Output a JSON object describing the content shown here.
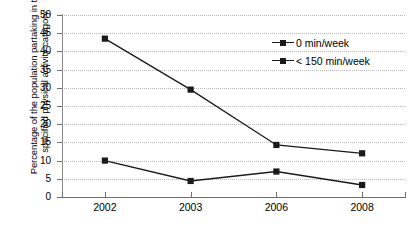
{
  "chart_data": {
    "type": "line",
    "title": "",
    "xlabel": "",
    "ylabel": "Percentage of the population partaking in the specified physical activity category",
    "categories": [
      "2002",
      "2003",
      "2006",
      "2008"
    ],
    "series": [
      {
        "name": "0 min/week",
        "values": [
          10,
          4.4,
          7,
          3.3
        ],
        "marker": "square",
        "color": "#1a1a1a"
      },
      {
        "name": "< 150 min/week",
        "values": [
          43.5,
          29.5,
          14.3,
          12
        ],
        "marker": "square",
        "color": "#1a1a1a"
      }
    ],
    "ylim": [
      0,
      50
    ],
    "ytick_step": 5,
    "yticks": [
      "0",
      "5",
      "10",
      "15",
      "20",
      "25",
      "30",
      "35",
      "40",
      "45",
      "50"
    ],
    "grid": true,
    "grid_axis": "y",
    "grid_style": "dotted",
    "grid_color": "#b9b9b9",
    "legend_position": "top-right",
    "background": "#ffffff",
    "axis_color": "#6e6e6e"
  },
  "axis": {
    "y_title": "Percentage of the population partaking in the specified physical activity category"
  },
  "legend": {
    "entries": [
      {
        "label": "0 min/week"
      },
      {
        "label": "< 150 min/week"
      }
    ]
  }
}
